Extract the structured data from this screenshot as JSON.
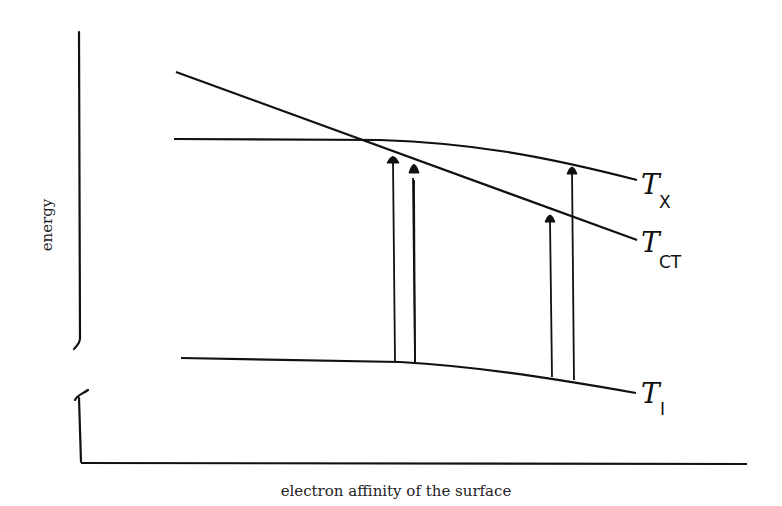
{
  "diagram": {
    "y_axis_label": "energy",
    "x_axis_label": "electron affinity of the surface",
    "axis_break": true,
    "curves": [
      {
        "id": "X",
        "symbol": "T",
        "subscript": "X",
        "description": "horizontal level, bending slightly down at right"
      },
      {
        "id": "CT",
        "symbol": "T",
        "subscript": "CT",
        "description": "steep descending straight line"
      },
      {
        "id": "I",
        "symbol": "T",
        "subscript": "I",
        "description": "low level, bending slightly down at right"
      }
    ],
    "arrows": [
      {
        "from": "I",
        "to": "CT",
        "position": "left pair, left arrow"
      },
      {
        "from": "I",
        "to": "X",
        "position": "left pair, right arrow"
      },
      {
        "from": "I",
        "to": "CT",
        "position": "right pair, left arrow"
      },
      {
        "from": "I",
        "to": "X",
        "position": "right pair, right arrow"
      }
    ],
    "colors": {
      "ink": "#111111",
      "background": "#ffffff"
    }
  }
}
